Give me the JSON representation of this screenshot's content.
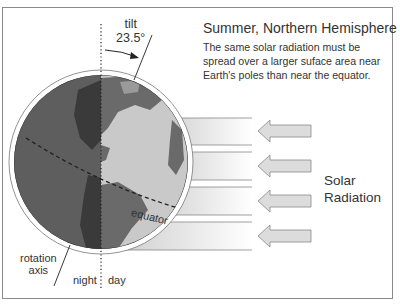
{
  "title": "Summer, Northern Hemisphere",
  "description": "The same solar radiation must be spread over a larger suface area near Earth's poles than near the equator.",
  "labels": {
    "tilt_word": "tilt",
    "tilt_angle": "23.5°",
    "equator": "equator",
    "rotation_axis_line1": "rotation",
    "rotation_axis_line2": "axis",
    "night": "night",
    "day": "day",
    "solar_line1": "Solar",
    "solar_line2": "Radiation"
  },
  "colors": {
    "night_ocean": "#5e5e5e",
    "night_land": "#3a3a3a",
    "day_ocean": "#c9c9c9",
    "day_land": "#6a6a6a",
    "arrow_fill": "#dcdcdc",
    "border": "#8a8a8a"
  },
  "arrows": {
    "count": 4,
    "direction": "left"
  },
  "bands": {
    "count": 4
  }
}
